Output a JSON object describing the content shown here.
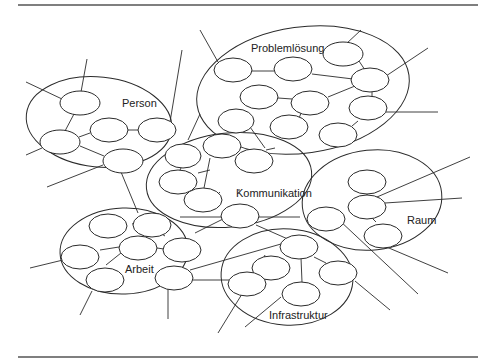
{
  "diagram": {
    "type": "cluster-network",
    "clusters": [
      {
        "id": "person",
        "label": "Person",
        "nodes": 5
      },
      {
        "id": "problemloesung",
        "label": "Problemlösung",
        "nodes": 11
      },
      {
        "id": "kommunikation",
        "label": "Kommunikation",
        "nodes": 7
      },
      {
        "id": "raum",
        "label": "Raum",
        "nodes": 4
      },
      {
        "id": "arbeit",
        "label": "Arbeit",
        "nodes": 7
      },
      {
        "id": "infrastruktur",
        "label": "Infrastruktur",
        "nodes": 5
      }
    ],
    "colors": {
      "stroke": "#2a2a2a",
      "rule": "#555555",
      "background": "#ffffff"
    }
  }
}
